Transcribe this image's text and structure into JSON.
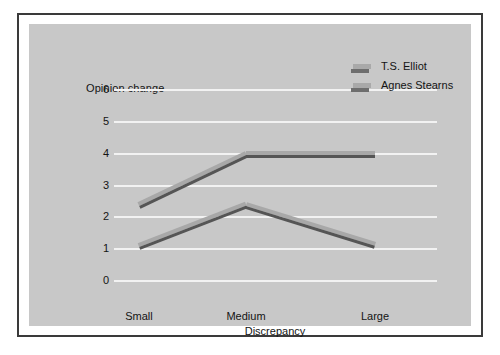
{
  "chart_data": {
    "type": "line",
    "title": "",
    "xlabel": "Discrepancy",
    "ylabel": "Opinion change",
    "categories": [
      "Small",
      "Medium",
      "Large"
    ],
    "yticks": [
      "0",
      "1",
      "2",
      "3",
      "4",
      "5",
      "6"
    ],
    "ylim": [
      0,
      6
    ],
    "grid": "horizontal",
    "legend_position": "top-right",
    "series": [
      {
        "name": "T.S. Elliot",
        "values": [
          2.4,
          4.0,
          4.0
        ],
        "color": "#a8a8a8"
      },
      {
        "name": "Agnes Stearns",
        "values": [
          1.1,
          2.4,
          1.15
        ],
        "color": "#a8a8a8"
      }
    ]
  },
  "legend": {
    "items": [
      {
        "label": "T.S. Elliot"
      },
      {
        "label": "Agnes Stearns"
      }
    ]
  },
  "colors": {
    "plot_background": "#c8c8c8",
    "gridline": "#f2f2f2",
    "ribbon_top": "#a8a8a8",
    "ribbon_face": "#555555",
    "frame_border": "#3a3a3a",
    "text": "#141414"
  }
}
